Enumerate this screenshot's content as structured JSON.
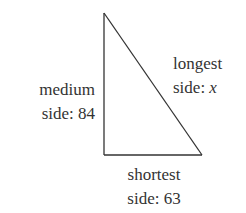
{
  "diagram": {
    "type": "right-triangle",
    "sides": {
      "medium": {
        "name": "medium",
        "label_prefix": "side: ",
        "value": "84"
      },
      "longest": {
        "name": "longest",
        "label_prefix": "side: ",
        "value": "x"
      },
      "shortest": {
        "name": "shortest",
        "label_prefix": "side: ",
        "value": "63"
      }
    },
    "stroke_color": "#333333"
  }
}
